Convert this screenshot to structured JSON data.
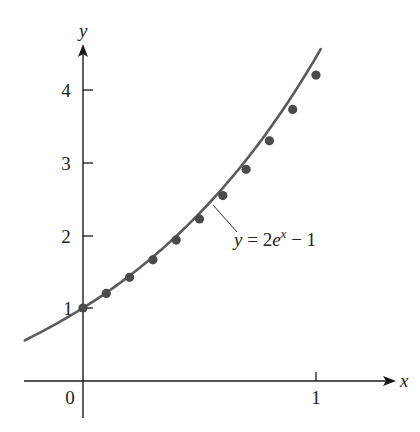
{
  "chart_data": {
    "type": "line",
    "title": "",
    "xlabel": "x",
    "ylabel": "y",
    "xlim": [
      -0.25,
      1.25
    ],
    "ylim": [
      -0.4,
      4.7
    ],
    "x_ticks": [
      {
        "value": 0,
        "label": "0"
      },
      {
        "value": 1,
        "label": "1"
      }
    ],
    "y_ticks": [
      {
        "value": 1,
        "label": "1"
      },
      {
        "value": 2,
        "label": "2"
      },
      {
        "value": 3,
        "label": "3"
      },
      {
        "value": 4,
        "label": "4"
      }
    ],
    "grid": false,
    "series": [
      {
        "name": "y = 2e^x − 1",
        "kind": "curve",
        "function": "2*exp(x)-1",
        "x_range": [
          -0.25,
          1.02
        ]
      },
      {
        "name": "approximation points",
        "kind": "scatter",
        "x": [
          0,
          0.1,
          0.2,
          0.3,
          0.4,
          0.5,
          0.6,
          0.7,
          0.8,
          0.9,
          1.0
        ],
        "y": [
          1.0,
          1.2,
          1.42,
          1.66,
          1.93,
          2.22,
          2.54,
          2.9,
          3.29,
          3.72,
          4.19
        ]
      }
    ],
    "annotations": [
      {
        "text": "y = 2e^x − 1",
        "points_to": [
          0.55,
          2.36
        ]
      }
    ]
  },
  "labels": {
    "x_axis": "x",
    "y_axis": "y",
    "origin": "0",
    "x_tick_1": "1",
    "y_tick_1": "1",
    "y_tick_2": "2",
    "y_tick_3": "3",
    "y_tick_4": "4",
    "curve_label_y": "y",
    "curve_label_eq": " = 2",
    "curve_label_e": "e",
    "curve_label_exp": "x",
    "curve_label_tail": " − 1"
  }
}
